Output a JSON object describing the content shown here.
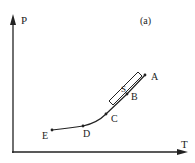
{
  "figure": {
    "panel_label": "(a)",
    "axes": {
      "y_label": "P",
      "x_label": "T"
    },
    "points": [
      {
        "id": "A",
        "label": "A"
      },
      {
        "id": "B",
        "label": "B"
      },
      {
        "id": "C",
        "label": "C"
      },
      {
        "id": "D",
        "label": "D"
      },
      {
        "id": "E",
        "label": "E"
      }
    ],
    "strip_label": "S",
    "colors": {
      "ink": "#222222",
      "background": "#ffffff"
    }
  }
}
